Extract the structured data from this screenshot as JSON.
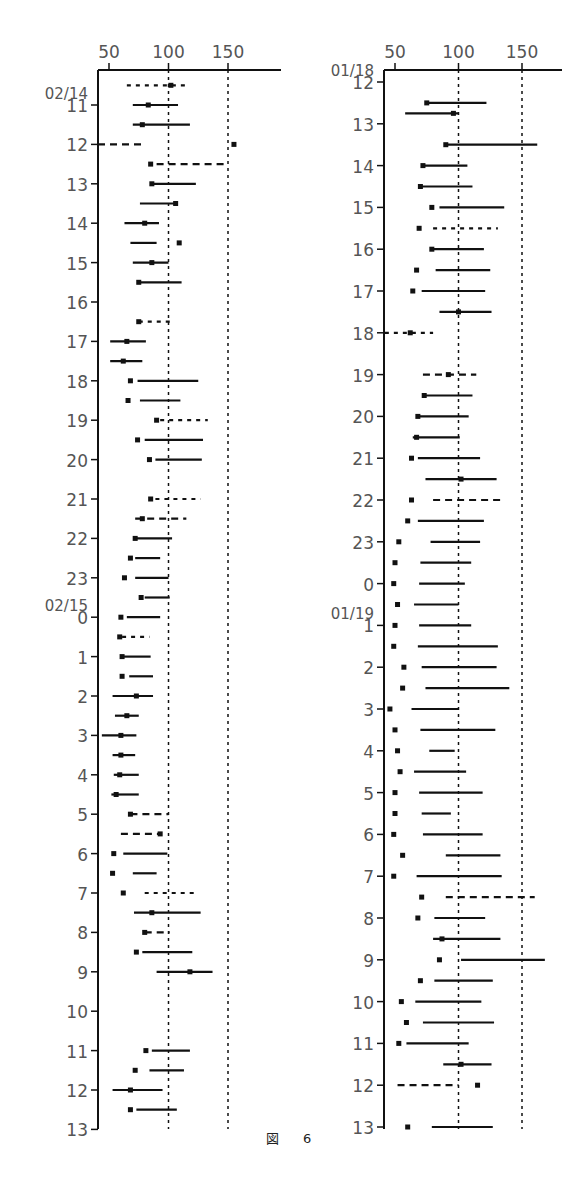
{
  "figure": {
    "caption_prefix": "図",
    "caption_number": "6"
  },
  "chart_data": [
    {
      "type": "scatter",
      "title": "",
      "xlabel": "",
      "ylabel": "",
      "xticks": [
        50,
        100,
        150
      ],
      "reference_lines": [
        100,
        150
      ],
      "xlim": [
        40,
        190
      ],
      "y_start_label": "02/14",
      "y_mid_date_label": "02/15",
      "yticks": [
        "11",
        "12",
        "13",
        "14",
        "15",
        "16",
        "17",
        "18",
        "19",
        "20",
        "21",
        "22",
        "23",
        "0",
        "1",
        "2",
        "3",
        "4",
        "5",
        "6",
        "7",
        "8",
        "9",
        "10",
        "11",
        "12",
        "13"
      ],
      "note": "Rows every 0.5h; each row: marker value (square), line [start,end], style",
      "rows": [
        {
          "t": 10.5,
          "marker": 102,
          "line": [
            65,
            115
          ],
          "style": "dotted"
        },
        {
          "t": 11.0,
          "marker": 83,
          "line": [
            70,
            108
          ],
          "style": "solid"
        },
        {
          "t": 11.5,
          "marker": 78,
          "line": [
            70,
            118
          ],
          "style": "solid"
        },
        {
          "t": 12.0,
          "marker": 155,
          "line": [
            40,
            80
          ],
          "style": "dashed"
        },
        {
          "t": 12.5,
          "marker": 85,
          "line": [
            90,
            148
          ],
          "style": "dashed"
        },
        {
          "t": 13.0,
          "marker": 86,
          "line": [
            86,
            123
          ],
          "style": "solid"
        },
        {
          "t": 13.5,
          "marker": 106,
          "line": [
            76,
            106
          ],
          "style": "solid"
        },
        {
          "t": 14.0,
          "marker": 80,
          "line": [
            63,
            92
          ],
          "style": "solid"
        },
        {
          "t": 14.5,
          "marker": 109,
          "line": [
            68,
            90
          ],
          "style": "solid"
        },
        {
          "t": 15.0,
          "marker": 86,
          "line": [
            70,
            100
          ],
          "style": "solid"
        },
        {
          "t": 15.5,
          "marker": 75,
          "line": [
            75,
            111
          ],
          "style": "solid"
        },
        {
          "t": 16.5,
          "marker": 75,
          "line": [
            75,
            105
          ],
          "style": "dotted"
        },
        {
          "t": 17.0,
          "marker": 65,
          "line": [
            51,
            81
          ],
          "style": "solid"
        },
        {
          "t": 17.5,
          "marker": 62,
          "line": [
            51,
            78
          ],
          "style": "solid"
        },
        {
          "t": 18.0,
          "marker": 68,
          "line": [
            74,
            125
          ],
          "style": "solid"
        },
        {
          "t": 18.5,
          "marker": 66,
          "line": [
            76,
            110
          ],
          "style": "solid"
        },
        {
          "t": 19.0,
          "marker": 90,
          "line": [
            93,
            133
          ],
          "style": "dotted"
        },
        {
          "t": 19.5,
          "marker": 74,
          "line": [
            80,
            129
          ],
          "style": "solid"
        },
        {
          "t": 20.0,
          "marker": 84,
          "line": [
            89,
            128
          ],
          "style": "solid"
        },
        {
          "t": 21.0,
          "marker": 85,
          "line": [
            89,
            127
          ],
          "style": "dotted"
        },
        {
          "t": 21.5,
          "marker": 78,
          "line": [
            72,
            115
          ],
          "style": "dashed"
        },
        {
          "t": 22.0,
          "marker": 72,
          "line": [
            72,
            103
          ],
          "style": "solid"
        },
        {
          "t": 22.5,
          "marker": 68,
          "line": [
            72,
            93
          ],
          "style": "solid"
        },
        {
          "t": 23.0,
          "marker": 63,
          "line": [
            72,
            100
          ],
          "style": "solid"
        },
        {
          "t": 23.5,
          "marker": 77,
          "line": [
            80,
            101
          ],
          "style": "solid"
        },
        {
          "t": 24.0,
          "marker": 60,
          "line": [
            65,
            93
          ],
          "style": "solid"
        },
        {
          "t": 24.5,
          "marker": 59,
          "line": [
            61,
            84
          ],
          "style": "dotted"
        },
        {
          "t": 25.0,
          "marker": 61,
          "line": [
            61,
            85
          ],
          "style": "solid"
        },
        {
          "t": 25.5,
          "marker": 61,
          "line": [
            67,
            87
          ],
          "style": "solid"
        },
        {
          "t": 26.0,
          "marker": 73,
          "line": [
            53,
            87
          ],
          "style": "solid"
        },
        {
          "t": 26.5,
          "marker": 65,
          "line": [
            55,
            75
          ],
          "style": "solid"
        },
        {
          "t": 27.0,
          "marker": 60,
          "line": [
            44,
            73
          ],
          "style": "solid"
        },
        {
          "t": 27.5,
          "marker": 60,
          "line": [
            53,
            72
          ],
          "style": "solid"
        },
        {
          "t": 28.0,
          "marker": 59,
          "line": [
            54,
            75
          ],
          "style": "solid"
        },
        {
          "t": 28.5,
          "marker": 56,
          "line": [
            52,
            75
          ],
          "style": "solid"
        },
        {
          "t": 29.0,
          "marker": 68,
          "line": [
            68,
            100
          ],
          "style": "dashed"
        },
        {
          "t": 29.5,
          "marker": 93,
          "line": [
            60,
            93
          ],
          "style": "dashed"
        },
        {
          "t": 30.0,
          "marker": 54,
          "line": [
            62,
            99
          ],
          "style": "solid"
        },
        {
          "t": 30.5,
          "marker": 53,
          "line": [
            70,
            90
          ],
          "style": "solid"
        },
        {
          "t": 31.0,
          "marker": 62,
          "line": [
            80,
            125
          ],
          "style": "dotted"
        },
        {
          "t": 31.5,
          "marker": 86,
          "line": [
            71,
            127
          ],
          "style": "solid"
        },
        {
          "t": 32.0,
          "marker": 80,
          "line": [
            80,
            101
          ],
          "style": "dashed"
        },
        {
          "t": 32.5,
          "marker": 73,
          "line": [
            78,
            120
          ],
          "style": "solid"
        },
        {
          "t": 33.0,
          "marker": 118,
          "line": [
            90,
            137
          ],
          "style": "solid"
        },
        {
          "t": 35.0,
          "marker": 81,
          "line": [
            86,
            118
          ],
          "style": "solid"
        },
        {
          "t": 35.5,
          "marker": 72,
          "line": [
            84,
            113
          ],
          "style": "solid"
        },
        {
          "t": 36.0,
          "marker": 68,
          "line": [
            53,
            95
          ],
          "style": "solid"
        },
        {
          "t": 36.5,
          "marker": 68,
          "line": [
            73,
            107
          ],
          "style": "solid"
        }
      ]
    },
    {
      "type": "scatter",
      "title": "",
      "xlabel": "",
      "ylabel": "",
      "xticks": [
        50,
        100,
        150
      ],
      "reference_lines": [
        100,
        150
      ],
      "xlim": [
        42,
        185
      ],
      "y_start_label": "01/18",
      "y_mid_date_label": "01/19",
      "yticks": [
        "12",
        "13",
        "14",
        "15",
        "16",
        "17",
        "18",
        "19",
        "20",
        "21",
        "22",
        "23",
        "0",
        "1",
        "2",
        "3",
        "4",
        "5",
        "6",
        "7",
        "8",
        "9",
        "10",
        "11",
        "12",
        "13"
      ],
      "rows": [
        {
          "t": 11.5,
          "marker": 75,
          "line": [
            75,
            122
          ],
          "style": "solid"
        },
        {
          "t": 11.75,
          "marker": 96,
          "line": [
            58,
            100
          ],
          "style": "solid"
        },
        {
          "t": 12.5,
          "marker": 90,
          "line": [
            90,
            162
          ],
          "style": "solid"
        },
        {
          "t": 13.0,
          "marker": 72,
          "line": [
            72,
            107
          ],
          "style": "solid"
        },
        {
          "t": 13.5,
          "marker": 70,
          "line": [
            70,
            111
          ],
          "style": "solid"
        },
        {
          "t": 14.0,
          "marker": 79,
          "line": [
            85,
            136
          ],
          "style": "solid"
        },
        {
          "t": 14.5,
          "marker": 69,
          "line": [
            80,
            131
          ],
          "style": "dotted"
        },
        {
          "t": 15.0,
          "marker": 79,
          "line": [
            79,
            120
          ],
          "style": "solid"
        },
        {
          "t": 15.5,
          "marker": 67,
          "line": [
            82,
            125
          ],
          "style": "solid"
        },
        {
          "t": 16.0,
          "marker": 64,
          "line": [
            71,
            121
          ],
          "style": "solid"
        },
        {
          "t": 16.5,
          "marker": 100,
          "line": [
            85,
            126
          ],
          "style": "solid"
        },
        {
          "t": 17.0,
          "marker": 62,
          "line": [
            42,
            80
          ],
          "style": "dotted"
        },
        {
          "t": 18.0,
          "marker": 92,
          "line": [
            72,
            114
          ],
          "style": "dashed"
        },
        {
          "t": 18.5,
          "marker": 73,
          "line": [
            73,
            111
          ],
          "style": "solid"
        },
        {
          "t": 19.0,
          "marker": 68,
          "line": [
            68,
            108
          ],
          "style": "solid"
        },
        {
          "t": 19.5,
          "marker": 67,
          "line": [
            64,
            101
          ],
          "style": "solid"
        },
        {
          "t": 20.0,
          "marker": 63,
          "line": [
            68,
            117
          ],
          "style": "solid"
        },
        {
          "t": 20.5,
          "marker": 102,
          "line": [
            74,
            130
          ],
          "style": "solid"
        },
        {
          "t": 21.0,
          "marker": 63,
          "line": [
            80,
            135
          ],
          "style": "dashed"
        },
        {
          "t": 21.5,
          "marker": 60,
          "line": [
            68,
            120
          ],
          "style": "solid"
        },
        {
          "t": 22.0,
          "marker": 53,
          "line": [
            78,
            117
          ],
          "style": "solid"
        },
        {
          "t": 22.5,
          "marker": 50,
          "line": [
            70,
            110
          ],
          "style": "solid"
        },
        {
          "t": 23.0,
          "marker": 49,
          "line": [
            69,
            105
          ],
          "style": "solid"
        },
        {
          "t": 23.5,
          "marker": 52,
          "line": [
            65,
            100
          ],
          "style": "solid"
        },
        {
          "t": 24.0,
          "marker": 50,
          "line": [
            69,
            110
          ],
          "style": "solid"
        },
        {
          "t": 24.5,
          "marker": 49,
          "line": [
            68,
            131
          ],
          "style": "solid"
        },
        {
          "t": 25.0,
          "marker": 57,
          "line": [
            71,
            130
          ],
          "style": "solid"
        },
        {
          "t": 25.5,
          "marker": 56,
          "line": [
            74,
            140
          ],
          "style": "solid"
        },
        {
          "t": 26.0,
          "marker": 46,
          "line": [
            63,
            100
          ],
          "style": "solid"
        },
        {
          "t": 26.5,
          "marker": 50,
          "line": [
            70,
            129
          ],
          "style": "solid"
        },
        {
          "t": 27.0,
          "marker": 52,
          "line": [
            77,
            97
          ],
          "style": "solid"
        },
        {
          "t": 27.5,
          "marker": 54,
          "line": [
            65,
            106
          ],
          "style": "solid"
        },
        {
          "t": 28.0,
          "marker": 50,
          "line": [
            69,
            119
          ],
          "style": "solid"
        },
        {
          "t": 28.5,
          "marker": 50,
          "line": [
            71,
            94
          ],
          "style": "solid"
        },
        {
          "t": 29.0,
          "marker": 49,
          "line": [
            72,
            119
          ],
          "style": "solid"
        },
        {
          "t": 29.5,
          "marker": 56,
          "line": [
            90,
            133
          ],
          "style": "solid"
        },
        {
          "t": 30.0,
          "marker": 49,
          "line": [
            67,
            134
          ],
          "style": "solid"
        },
        {
          "t": 30.5,
          "marker": 71,
          "line": [
            90,
            160
          ],
          "style": "dashed"
        },
        {
          "t": 31.0,
          "marker": 68,
          "line": [
            81,
            121
          ],
          "style": "solid"
        },
        {
          "t": 31.5,
          "marker": 87,
          "line": [
            80,
            133
          ],
          "style": "solid"
        },
        {
          "t": 32.0,
          "marker": 85,
          "line": [
            102,
            168
          ],
          "style": "solid"
        },
        {
          "t": 32.5,
          "marker": 70,
          "line": [
            81,
            127
          ],
          "style": "solid"
        },
        {
          "t": 33.0,
          "marker": 55,
          "line": [
            66,
            118
          ],
          "style": "solid"
        },
        {
          "t": 33.5,
          "marker": 59,
          "line": [
            72,
            128
          ],
          "style": "solid"
        },
        {
          "t": 34.0,
          "marker": 53,
          "line": [
            59,
            108
          ],
          "style": "solid"
        },
        {
          "t": 34.5,
          "marker": 102,
          "line": [
            88,
            126
          ],
          "style": "solid"
        },
        {
          "t": 35.0,
          "marker": 115,
          "line": [
            52,
            100
          ],
          "style": "dashed"
        },
        {
          "t": 36.0,
          "marker": 60,
          "line": [
            79,
            127
          ],
          "style": "solid"
        }
      ]
    }
  ]
}
